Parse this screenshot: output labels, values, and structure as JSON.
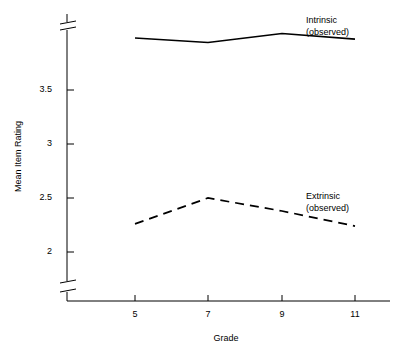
{
  "chart_data": {
    "type": "line",
    "title": "",
    "xlabel": "Grade",
    "ylabel": "Mean Item Rating",
    "categories": [
      "5",
      "7",
      "9",
      "11"
    ],
    "x": [
      5,
      7,
      9,
      11
    ],
    "xlim": [
      4,
      12
    ],
    "ylim": [
      1.75,
      4.1
    ],
    "yticks": [
      "3.5",
      "3",
      "2.5",
      "2"
    ],
    "ytick_values": [
      3.5,
      3,
      2.5,
      2
    ],
    "grid": false,
    "legend_position": "inline-right",
    "axis_break": true,
    "axis_break_note": "y-axis has break marks at top and bottom",
    "series": [
      {
        "name": "Intrinsic (observed)",
        "label_line1": "Intrinsic",
        "label_line2": "(observed)",
        "style": "solid",
        "color": "#000000",
        "values": [
          3.97,
          3.93,
          4.01,
          3.96
        ]
      },
      {
        "name": "Extrinsic (observed)",
        "label_line1": "Extrinsic",
        "label_line2": "(observed)",
        "style": "dashed",
        "color": "#000000",
        "values": [
          2.26,
          2.5,
          2.38,
          2.24
        ]
      }
    ]
  },
  "axes": {
    "y_title": "Mean Item Rating",
    "x_title": "Grade",
    "ytick_labels": [
      "3.5",
      "3",
      "2.5",
      "2"
    ],
    "xtick_labels": [
      "5",
      "7",
      "9",
      "11"
    ]
  },
  "legend": {
    "intrinsic_line1": "Intrinsic",
    "intrinsic_line2": "(observed)",
    "extrinsic_line1": "Extrinsic",
    "extrinsic_line2": "(observed)"
  },
  "colors": {
    "axis": "#000000",
    "series_intrinsic": "#000000",
    "series_extrinsic": "#000000",
    "background": "#ffffff"
  }
}
